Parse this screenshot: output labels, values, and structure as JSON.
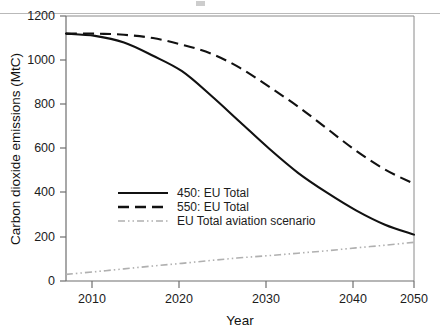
{
  "figure": {
    "background_color": "#ffffff",
    "frame_color": "#6e6e6e"
  },
  "chart_data": {
    "type": "line",
    "title": "",
    "xlabel": "Year",
    "ylabel": "Carbon dioxide emissions (MtC)",
    "xlim": [
      2002,
      2050
    ],
    "ylim": [
      0,
      1200
    ],
    "xticks": [
      2010,
      2020,
      2030,
      2040,
      2050
    ],
    "xtick_labels": [
      "2010",
      "2020",
      "2030",
      "2040",
      "2050"
    ],
    "yticks": [
      0,
      200,
      400,
      600,
      800,
      1000,
      1200
    ],
    "ytick_labels": [
      "0",
      "200",
      "400",
      "600",
      "800",
      "1000",
      "1200"
    ],
    "grid": false,
    "legend_position": "center-left",
    "x": [
      2002,
      2006,
      2010,
      2014,
      2018,
      2022,
      2026,
      2030,
      2034,
      2038,
      2042,
      2046,
      2050
    ],
    "series": [
      {
        "name": "450: EU Total",
        "style": "solid",
        "color": "#111111",
        "values": [
          1120,
          1110,
          1080,
          1020,
          950,
          840,
          720,
          600,
          490,
          400,
          320,
          255,
          210
        ]
      },
      {
        "name": "550: EU Total",
        "style": "dashed",
        "color": "#111111",
        "values": [
          1120,
          1120,
          1115,
          1100,
          1070,
          1030,
          965,
          880,
          790,
          690,
          590,
          505,
          440
        ]
      },
      {
        "name": "EU Total aviation scenario",
        "style": "dash-dot-dot",
        "color": "#b0b0b0",
        "values": [
          30,
          42,
          55,
          68,
          80,
          93,
          105,
          115,
          126,
          137,
          150,
          162,
          175
        ]
      }
    ]
  },
  "legend": {
    "items": [
      {
        "label": "450: EU Total",
        "style": "solid",
        "color": "#111111"
      },
      {
        "label": "550: EU Total",
        "style": "dashed",
        "color": "#111111"
      },
      {
        "label": "EU Total aviation scenario",
        "style": "dash-dot-dot",
        "color": "#b0b0b0"
      }
    ]
  }
}
